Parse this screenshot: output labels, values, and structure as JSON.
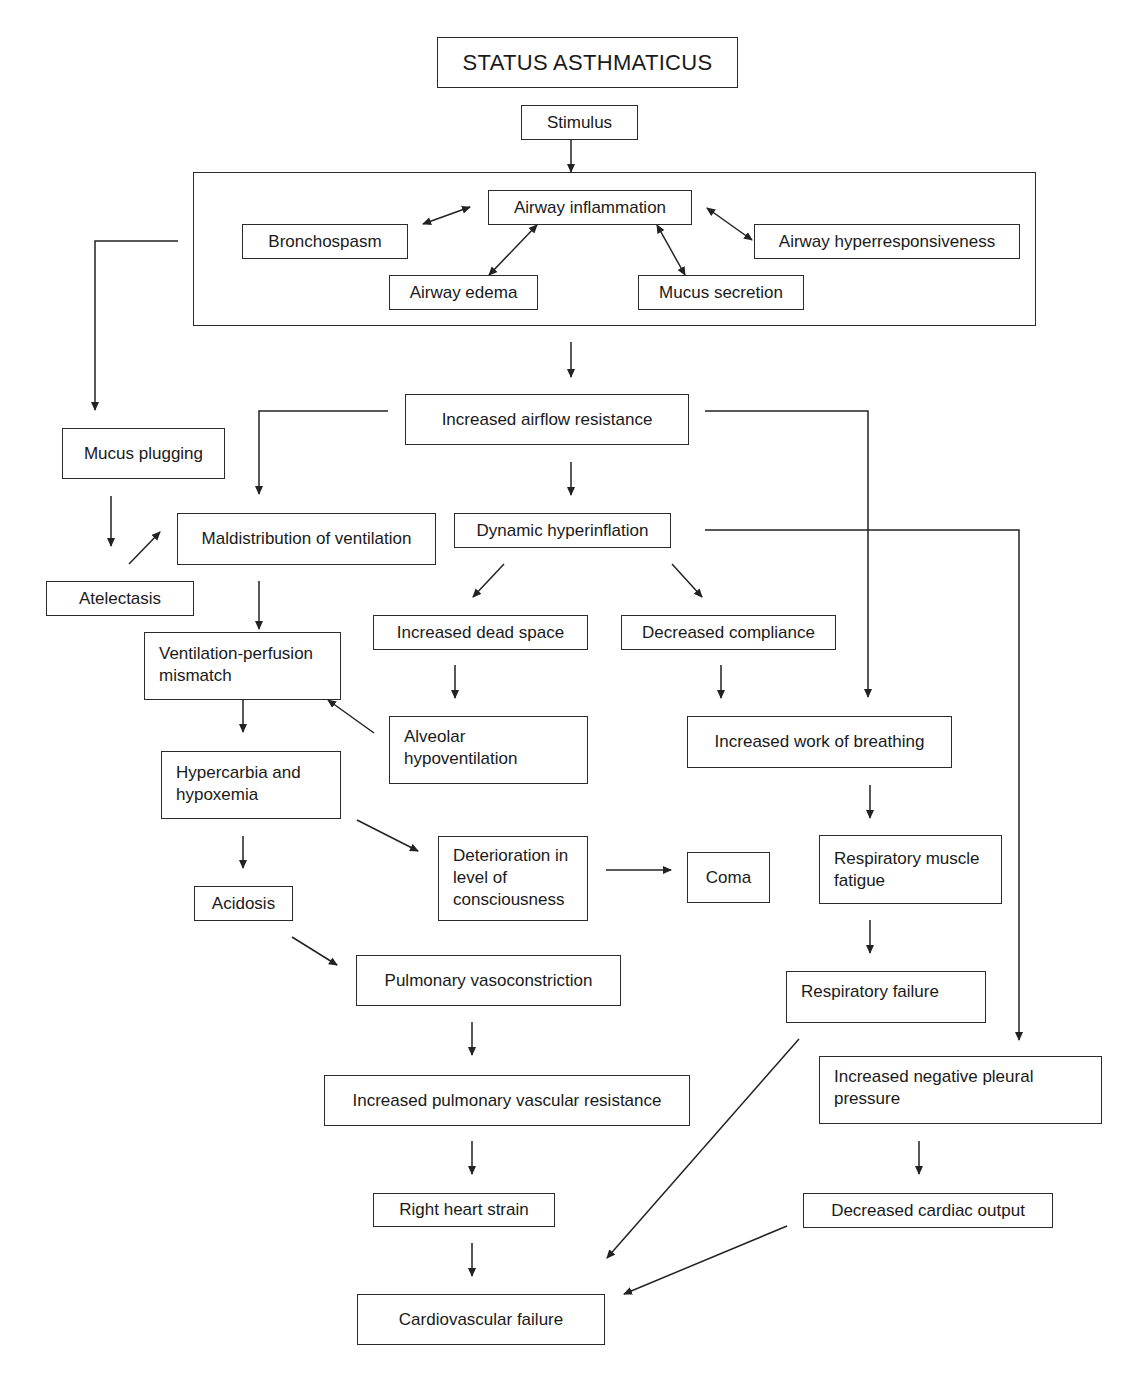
{
  "title": "STATUS ASTHMATICUS",
  "nodes": {
    "stimulus": "Stimulus",
    "airway_inflammation": "Airway inflammation",
    "bronchospasm": "Bronchospasm",
    "airway_hyperresponsiveness": "Airway hyperresponsiveness",
    "airway_edema": "Airway edema",
    "mucus_secretion": "Mucus secretion",
    "increased_airflow_resistance": "Increased airflow resistance",
    "mucus_plugging": "Mucus plugging",
    "maldistribution_of_ventilation": "Maldistribution of ventilation",
    "dynamic_hyperinflation": "Dynamic hyperinflation",
    "atelectasis": "Atelectasis",
    "increased_dead_space": "Increased dead space",
    "decreased_compliance": "Decreased compliance",
    "vq_mismatch": "Ventilation-perfusion mismatch",
    "alveolar_hypoventilation": "Alveolar hypoventilation",
    "increased_work_of_breathing": "Increased work of breathing",
    "hypercarbia_hypoxemia": "Hypercarbia and hypoxemia",
    "deterioration_consciousness": "Deterioration in level of consciousness",
    "coma": "Coma",
    "respiratory_muscle_fatigue": "Respiratory muscle fatigue",
    "acidosis": "Acidosis",
    "pulmonary_vasoconstriction": "Pulmonary vasoconstriction",
    "respiratory_failure": "Respiratory failure",
    "increased_pvr": "Increased pulmonary vascular resistance",
    "increased_negative_pleural_pressure": "Increased negative pleural pressure",
    "right_heart_strain": "Right heart strain",
    "decreased_cardiac_output": "Decreased cardiac output",
    "cardiovascular_failure": "Cardiovascular failure"
  },
  "edges": [
    {
      "from": "title",
      "to": "stimulus"
    },
    {
      "from": "stimulus",
      "to": "airway_response_group"
    },
    {
      "from": "airway_inflammation",
      "to": "bronchospasm",
      "bidirectional": true
    },
    {
      "from": "airway_inflammation",
      "to": "airway_hyperresponsiveness",
      "bidirectional": true
    },
    {
      "from": "airway_inflammation",
      "to": "airway_edema",
      "bidirectional": true
    },
    {
      "from": "airway_inflammation",
      "to": "mucus_secretion",
      "bidirectional": true
    },
    {
      "from": "airway_response_group",
      "to": "mucus_plugging"
    },
    {
      "from": "airway_response_group",
      "to": "increased_airflow_resistance"
    },
    {
      "from": "increased_airflow_resistance",
      "to": "maldistribution_of_ventilation"
    },
    {
      "from": "increased_airflow_resistance",
      "to": "dynamic_hyperinflation"
    },
    {
      "from": "increased_airflow_resistance",
      "to": "increased_work_of_breathing"
    },
    {
      "from": "mucus_plugging",
      "to": "atelectasis"
    },
    {
      "from": "atelectasis",
      "to": "maldistribution_of_ventilation"
    },
    {
      "from": "maldistribution_of_ventilation",
      "to": "vq_mismatch"
    },
    {
      "from": "dynamic_hyperinflation",
      "to": "increased_dead_space"
    },
    {
      "from": "dynamic_hyperinflation",
      "to": "decreased_compliance"
    },
    {
      "from": "dynamic_hyperinflation",
      "to": "increased_negative_pleural_pressure"
    },
    {
      "from": "increased_dead_space",
      "to": "alveolar_hypoventilation"
    },
    {
      "from": "alveolar_hypoventilation",
      "to": "vq_mismatch"
    },
    {
      "from": "decreased_compliance",
      "to": "increased_work_of_breathing"
    },
    {
      "from": "vq_mismatch",
      "to": "hypercarbia_hypoxemia"
    },
    {
      "from": "hypercarbia_hypoxemia",
      "to": "acidosis"
    },
    {
      "from": "hypercarbia_hypoxemia",
      "to": "deterioration_consciousness"
    },
    {
      "from": "deterioration_consciousness",
      "to": "coma"
    },
    {
      "from": "increased_work_of_breathing",
      "to": "respiratory_muscle_fatigue"
    },
    {
      "from": "respiratory_muscle_fatigue",
      "to": "respiratory_failure"
    },
    {
      "from": "acidosis",
      "to": "pulmonary_vasoconstriction"
    },
    {
      "from": "pulmonary_vasoconstriction",
      "to": "increased_pvr"
    },
    {
      "from": "increased_pvr",
      "to": "right_heart_strain"
    },
    {
      "from": "right_heart_strain",
      "to": "cardiovascular_failure"
    },
    {
      "from": "respiratory_failure",
      "to": "cardiovascular_failure"
    },
    {
      "from": "increased_negative_pleural_pressure",
      "to": "decreased_cardiac_output"
    },
    {
      "from": "decreased_cardiac_output",
      "to": "cardiovascular_failure"
    }
  ]
}
